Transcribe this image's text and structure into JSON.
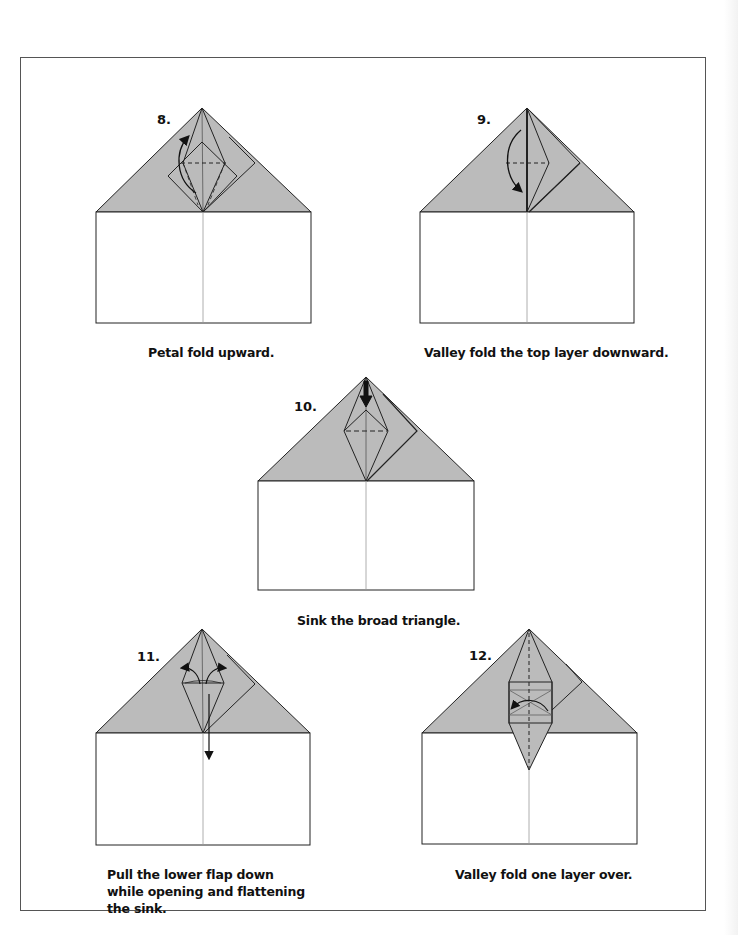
{
  "page": {
    "frame_color": "#555555",
    "paper_fill": "#bbbbbb",
    "line_color": "#222222"
  },
  "steps": [
    {
      "number": "8.",
      "caption": "Petal fold upward."
    },
    {
      "number": "9.",
      "caption": "Valley fold the top layer downward."
    },
    {
      "number": "10.",
      "caption": "Sink the broad triangle."
    },
    {
      "number": "11.",
      "caption": "Pull the lower flap down while opening and flattening the sink."
    },
    {
      "number": "12.",
      "caption": "Valley fold one layer over."
    }
  ]
}
